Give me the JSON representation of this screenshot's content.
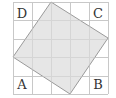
{
  "figure": {
    "grid": {
      "cols": 5,
      "rows": 5,
      "x_lines": [
        13,
        32,
        51,
        70,
        89,
        108
      ],
      "y_lines": [
        2,
        20,
        39,
        57,
        76,
        94
      ],
      "line_color": "#c8c8c8"
    },
    "tilted_square": {
      "points": "51,2 108,38 70,94 13,57",
      "fill": "#e6e6e6",
      "stroke": "#9a9a9a"
    },
    "labels": {
      "A": "A",
      "B": "B",
      "C": "C",
      "D": "D"
    },
    "label_positions": {
      "A": [
        22,
        89
      ],
      "B": [
        98,
        89
      ],
      "C": [
        98,
        18
      ],
      "D": [
        22,
        18
      ]
    }
  }
}
